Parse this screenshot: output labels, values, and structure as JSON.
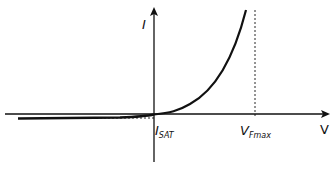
{
  "diagram": {
    "title": "",
    "type": "diode I-V characteristic curve",
    "axes": {
      "x_label": "V",
      "y_label": "I"
    },
    "annotations": {
      "isat": {
        "main": "I",
        "sub": "SAT"
      },
      "vfmax": {
        "main": "V",
        "sub": "Fmax"
      }
    },
    "colors": {
      "stroke": "#111111",
      "background": "#ffffff"
    }
  }
}
